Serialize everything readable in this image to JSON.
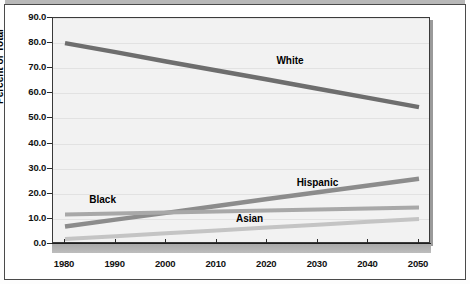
{
  "chart_data": {
    "type": "line",
    "title": "",
    "subtitle": "",
    "xlabel": "",
    "ylabel": "Percent of Total",
    "x": [
      1980,
      1990,
      2000,
      2010,
      2020,
      2030,
      2040,
      2050
    ],
    "xlim": [
      1980,
      2050
    ],
    "ylim": [
      0.0,
      90.0
    ],
    "ytick_labels": [
      "90.0",
      "80.0",
      "70.0",
      "60.0",
      "50.0",
      "40.0",
      "30.0",
      "20.0",
      "10.0",
      "0.0"
    ],
    "ytick_values": [
      90.0,
      80.0,
      70.0,
      60.0,
      50.0,
      40.0,
      30.0,
      20.0,
      10.0,
      0.0
    ],
    "xtick_labels": [
      "1980",
      "1990",
      "2000",
      "2010",
      "2020",
      "2030",
      "2040",
      "2050"
    ],
    "grid": true,
    "grid_axis": "y",
    "legend": "inline-labels",
    "series": [
      {
        "name": "White",
        "color": "#6e6e6e",
        "width": 4.5,
        "values": [
          80.0,
          76.4,
          72.7,
          69.1,
          65.5,
          61.8,
          58.2,
          54.5
        ],
        "label_x": 2022,
        "label_y": 72.5
      },
      {
        "name": "Hispanic",
        "color": "#8c8c8c",
        "width": 4.5,
        "values": [
          7.0,
          9.7,
          12.4,
          15.1,
          17.9,
          20.6,
          23.3,
          26.0
        ],
        "label_x": 2026,
        "label_y": 24.0
      },
      {
        "name": "Black",
        "color": "#a8a8a8",
        "width": 4.0,
        "values": [
          11.7,
          12.1,
          12.5,
          12.9,
          13.3,
          13.7,
          14.1,
          14.5
        ],
        "label_x": 1985,
        "label_y": 17.2
      },
      {
        "name": "Asian",
        "color": "#c4c4c4",
        "width": 4.0,
        "values": [
          2.0,
          3.1,
          4.3,
          5.4,
          6.6,
          7.7,
          8.9,
          10.0
        ],
        "label_x": 2014,
        "label_y": 9.6
      }
    ]
  }
}
